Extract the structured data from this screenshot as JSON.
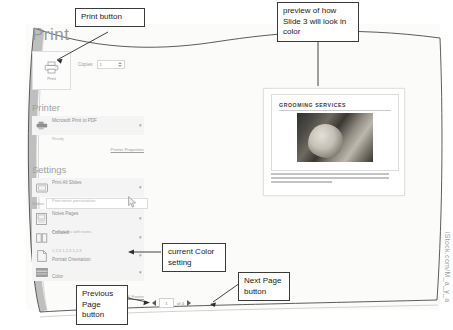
{
  "print_pane": {
    "page_title": "Print",
    "print_button_label": "Print",
    "copies_label": "Copies:",
    "copies_value": "1",
    "printer_section_title": "Printer",
    "printer_name": "Microsoft Print to PDF",
    "printer_status": "Ready",
    "printer_properties_link": "Printer Properties",
    "settings_section_title": "Settings",
    "slides_label": "Slides:",
    "slides_value": "",
    "edit_header_footer_link": "Edit Header & Footer",
    "options": [
      {
        "id": "print-range",
        "icon": "slide-icon",
        "primary": "Print All Slides",
        "secondary": "Print entire presentation"
      },
      {
        "id": "print-layout",
        "icon": "notes-page-icon",
        "primary": "Notes Pages",
        "secondary": "Print slides with notes"
      },
      {
        "id": "collation",
        "icon": "collate-icon",
        "primary": "Collated",
        "secondary": "1,2,3   1,2,3   1,2,3"
      },
      {
        "id": "orientation",
        "icon": "portrait-page-icon",
        "primary": "Portrait Orientation",
        "secondary": ""
      },
      {
        "id": "color",
        "icon": "color-swatch-icon",
        "primary": "Color",
        "secondary": ""
      }
    ]
  },
  "preview": {
    "slide_title": "GROOMING SERVICES",
    "photo_alt": "dog-being-groomed-photo",
    "notes_lines": [
      "We offer quality dog and cat grooming services performed by our experienced pet stylist.",
      "We will pamper your pet with a bath, nail trimming, and ear cleaning. Services come in strict",
      "based on the perfectly breed and coat."
    ]
  },
  "pager": {
    "previous_icon": "previous-page-arrow-icon",
    "next_icon": "next-page-arrow-icon",
    "current_page": "1",
    "of_label": "of 4"
  },
  "callouts": {
    "print_button": "Print button",
    "preview": "preview of how Slide 3 will look in color",
    "color_setting": "current Color setting",
    "previous_page": "Previous Page button",
    "next_page": "Next Page button"
  },
  "watermark": "iStock.com/M_a_y_a",
  "colors": {
    "page_background": "#fbfbfa",
    "settings_block": "#f4f4f4",
    "muted_text": "#9a9a9a",
    "callout_border": "#3a3a3a"
  }
}
